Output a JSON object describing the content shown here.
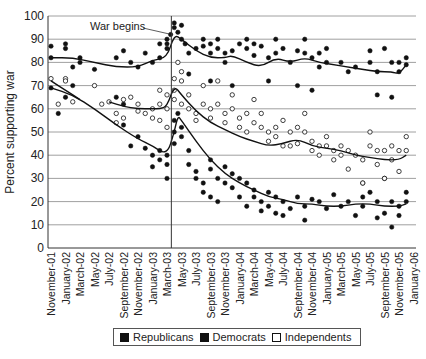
{
  "chart_data": {
    "type": "scatter",
    "title": "",
    "xlabel": "",
    "ylabel": "Percent supporting war",
    "ylim": [
      0,
      100
    ],
    "yticks": [
      0,
      10,
      20,
      30,
      40,
      50,
      60,
      70,
      80,
      90,
      100
    ],
    "grid": "horizontal",
    "x_tick_labels": [
      "November-01",
      "January-02",
      "March-02",
      "May-02",
      "July-02",
      "September-02",
      "November-02",
      "January-03",
      "March-03",
      "May-03",
      "July-03",
      "September-03",
      "November-03",
      "January-04",
      "March-04",
      "May-04",
      "July-04",
      "September-04",
      "November-04",
      "January-05",
      "March-05",
      "May-05",
      "July-05",
      "September-05",
      "November-05",
      "January-06"
    ],
    "x_unit": "months since November 2001 (0 = November-01, 50 = January-06)",
    "xlim": [
      0,
      50
    ],
    "annotation": {
      "text": "War begins",
      "x": 16.6
    },
    "legend": {
      "placement": "bottom",
      "entries": [
        "Republicans",
        "Democrats",
        "Independents"
      ]
    },
    "series": [
      {
        "name": "Republicans",
        "marker": "filled",
        "points": [
          [
            0,
            87
          ],
          [
            0,
            82
          ],
          [
            2,
            88
          ],
          [
            2,
            86
          ],
          [
            3,
            78
          ],
          [
            4,
            82
          ],
          [
            4,
            80
          ],
          [
            9,
            82
          ],
          [
            10,
            85
          ],
          [
            11,
            80
          ],
          [
            12,
            78
          ],
          [
            13,
            84
          ],
          [
            14,
            80
          ],
          [
            15,
            88
          ],
          [
            15,
            82
          ],
          [
            16,
            86
          ],
          [
            16,
            90
          ],
          [
            16,
            88
          ],
          [
            16.5,
            92
          ],
          [
            17,
            95
          ],
          [
            17,
            97
          ],
          [
            17.5,
            93
          ],
          [
            18,
            96
          ],
          [
            18,
            90
          ],
          [
            18.5,
            88
          ],
          [
            19,
            84
          ],
          [
            20,
            86
          ],
          [
            21,
            90
          ],
          [
            21,
            87
          ],
          [
            22,
            88
          ],
          [
            22,
            84
          ],
          [
            23,
            90
          ],
          [
            23,
            86
          ],
          [
            24,
            84
          ],
          [
            24,
            80
          ],
          [
            25,
            85
          ],
          [
            26,
            88
          ],
          [
            27,
            90
          ],
          [
            27,
            86
          ],
          [
            28,
            88
          ],
          [
            28,
            83
          ],
          [
            29,
            87
          ],
          [
            30,
            82
          ],
          [
            31,
            90
          ],
          [
            31,
            84
          ],
          [
            32,
            86
          ],
          [
            33,
            80
          ],
          [
            34,
            85
          ],
          [
            35,
            90
          ],
          [
            35,
            84
          ],
          [
            36,
            82
          ],
          [
            37,
            78
          ],
          [
            37,
            84
          ],
          [
            38,
            86
          ],
          [
            38,
            80
          ],
          [
            40,
            80
          ],
          [
            41,
            76
          ],
          [
            42,
            78
          ],
          [
            44,
            85
          ],
          [
            44,
            80
          ],
          [
            45,
            76
          ],
          [
            46,
            86
          ],
          [
            47,
            80
          ],
          [
            48,
            80
          ],
          [
            48,
            76
          ],
          [
            49,
            82
          ],
          [
            49,
            79
          ],
          [
            19,
            75
          ],
          [
            22,
            72
          ],
          [
            25,
            70
          ],
          [
            30,
            72
          ],
          [
            34,
            70
          ],
          [
            36,
            68
          ],
          [
            45,
            66
          ],
          [
            47,
            65
          ]
        ],
        "trend": [
          [
            0,
            82
          ],
          [
            3,
            82
          ],
          [
            6,
            80
          ],
          [
            9,
            78
          ],
          [
            12,
            78
          ],
          [
            14,
            81
          ],
          [
            16,
            82
          ],
          [
            17,
            92
          ],
          [
            18,
            90
          ],
          [
            20,
            85
          ],
          [
            22,
            82
          ],
          [
            24,
            82
          ],
          [
            25,
            83
          ],
          [
            27,
            80
          ],
          [
            29,
            78
          ],
          [
            31,
            82
          ],
          [
            33,
            80
          ],
          [
            35,
            82
          ],
          [
            37,
            80
          ],
          [
            39,
            79
          ],
          [
            41,
            78
          ],
          [
            43,
            77
          ],
          [
            45,
            76
          ],
          [
            47,
            76
          ],
          [
            48,
            75
          ],
          [
            49,
            79
          ]
        ]
      },
      {
        "name": "Democrats",
        "marker": "filled",
        "points": [
          [
            0,
            69
          ],
          [
            1,
            58
          ],
          [
            2,
            65
          ],
          [
            3,
            70
          ],
          [
            6,
            77
          ],
          [
            9,
            65
          ],
          [
            10,
            62
          ],
          [
            10,
            53
          ],
          [
            11,
            44
          ],
          [
            12,
            48
          ],
          [
            13,
            43
          ],
          [
            14,
            40
          ],
          [
            14,
            35
          ],
          [
            15,
            42
          ],
          [
            15,
            38
          ],
          [
            16,
            40
          ],
          [
            16,
            36
          ],
          [
            16,
            30
          ],
          [
            17,
            45
          ],
          [
            17,
            50
          ],
          [
            17,
            55
          ],
          [
            17.5,
            58
          ],
          [
            18,
            52
          ],
          [
            18,
            48
          ],
          [
            19,
            42
          ],
          [
            19,
            36
          ],
          [
            20,
            33
          ],
          [
            20,
            30
          ],
          [
            21,
            28
          ],
          [
            21,
            24
          ],
          [
            22,
            38
          ],
          [
            22,
            34
          ],
          [
            22,
            22
          ],
          [
            23,
            30
          ],
          [
            23,
            20
          ],
          [
            24,
            35
          ],
          [
            24,
            28
          ],
          [
            25,
            32
          ],
          [
            25,
            26
          ],
          [
            26,
            30
          ],
          [
            26,
            22
          ],
          [
            27,
            28
          ],
          [
            27,
            18
          ],
          [
            28,
            25
          ],
          [
            28,
            22
          ],
          [
            29,
            20
          ],
          [
            29,
            16
          ],
          [
            30,
            24
          ],
          [
            30,
            18
          ],
          [
            31,
            22
          ],
          [
            31,
            15
          ],
          [
            32,
            20
          ],
          [
            32,
            14
          ],
          [
            33,
            17
          ],
          [
            34,
            22
          ],
          [
            35,
            18
          ],
          [
            35,
            12
          ],
          [
            36,
            21
          ],
          [
            37,
            20
          ],
          [
            38,
            17
          ],
          [
            39,
            23
          ],
          [
            40,
            18
          ],
          [
            41,
            20
          ],
          [
            42,
            14
          ],
          [
            43,
            22
          ],
          [
            43,
            18
          ],
          [
            44,
            24
          ],
          [
            45,
            20
          ],
          [
            45,
            13
          ],
          [
            46,
            15
          ],
          [
            47,
            20
          ],
          [
            47,
            9
          ],
          [
            48,
            18
          ],
          [
            48,
            14
          ],
          [
            49,
            24
          ],
          [
            49,
            20
          ],
          [
            46,
            30
          ],
          [
            43,
            28
          ]
        ],
        "trend": [
          [
            0,
            69
          ],
          [
            3,
            66
          ],
          [
            6,
            60
          ],
          [
            9,
            53
          ],
          [
            12,
            47
          ],
          [
            14,
            44
          ],
          [
            16,
            40
          ],
          [
            17,
            50
          ],
          [
            17.5,
            57
          ],
          [
            18,
            55
          ],
          [
            20,
            46
          ],
          [
            22,
            38
          ],
          [
            24,
            32
          ],
          [
            26,
            28
          ],
          [
            28,
            25
          ],
          [
            30,
            22
          ],
          [
            32,
            21
          ],
          [
            34,
            19
          ],
          [
            36,
            19
          ],
          [
            38,
            18
          ],
          [
            40,
            18
          ],
          [
            42,
            19
          ],
          [
            44,
            19
          ],
          [
            46,
            18
          ],
          [
            48,
            18
          ],
          [
            49,
            19
          ]
        ]
      },
      {
        "name": "Independents",
        "marker": "open",
        "points": [
          [
            0,
            73
          ],
          [
            1,
            62
          ],
          [
            2,
            73
          ],
          [
            2,
            72
          ],
          [
            3,
            63
          ],
          [
            6,
            70
          ],
          [
            7,
            62
          ],
          [
            8,
            63
          ],
          [
            9,
            58
          ],
          [
            9,
            54
          ],
          [
            10,
            64
          ],
          [
            10,
            56
          ],
          [
            11,
            65
          ],
          [
            12,
            62
          ],
          [
            12,
            59
          ],
          [
            13,
            58
          ],
          [
            14,
            60
          ],
          [
            14,
            56
          ],
          [
            15,
            68
          ],
          [
            15,
            62
          ],
          [
            15,
            55
          ],
          [
            16,
            66
          ],
          [
            16,
            60
          ],
          [
            16,
            52
          ],
          [
            17,
            73
          ],
          [
            17,
            68
          ],
          [
            17,
            64
          ],
          [
            17.5,
            80
          ],
          [
            18,
            76
          ],
          [
            18,
            72
          ],
          [
            18,
            62
          ],
          [
            19,
            66
          ],
          [
            19,
            60
          ],
          [
            20,
            58
          ],
          [
            20,
            55
          ],
          [
            21,
            70
          ],
          [
            21,
            62
          ],
          [
            22,
            60
          ],
          [
            22,
            56
          ],
          [
            23,
            72
          ],
          [
            23,
            62
          ],
          [
            24,
            58
          ],
          [
            24,
            54
          ],
          [
            25,
            66
          ],
          [
            25,
            60
          ],
          [
            26,
            56
          ],
          [
            26,
            52
          ],
          [
            27,
            58
          ],
          [
            27,
            50
          ],
          [
            28,
            64
          ],
          [
            28,
            54
          ],
          [
            29,
            58
          ],
          [
            29,
            52
          ],
          [
            30,
            50
          ],
          [
            30,
            46
          ],
          [
            31,
            52
          ],
          [
            31,
            48
          ],
          [
            32,
            55
          ],
          [
            32,
            44
          ],
          [
            33,
            50
          ],
          [
            33,
            44
          ],
          [
            34,
            52
          ],
          [
            34,
            45
          ],
          [
            35,
            58
          ],
          [
            35,
            50
          ],
          [
            36,
            46
          ],
          [
            36,
            42
          ],
          [
            37,
            44
          ],
          [
            37,
            40
          ],
          [
            38,
            48
          ],
          [
            38,
            44
          ],
          [
            39,
            42
          ],
          [
            39,
            38
          ],
          [
            40,
            44
          ],
          [
            40,
            40
          ],
          [
            41,
            42
          ],
          [
            41,
            34
          ],
          [
            42,
            40
          ],
          [
            43,
            38
          ],
          [
            43,
            28
          ],
          [
            44,
            50
          ],
          [
            44,
            44
          ],
          [
            45,
            42
          ],
          [
            45,
            36
          ],
          [
            46,
            42
          ],
          [
            46,
            30
          ],
          [
            47,
            44
          ],
          [
            47,
            38
          ],
          [
            48,
            42
          ],
          [
            48,
            33
          ],
          [
            49,
            48
          ],
          [
            49,
            42
          ]
        ],
        "trend_segments": [
          [
            [
              0,
              72
            ],
            [
              2,
              68
            ],
            [
              4,
              64
            ]
          ],
          [
            [
              8,
              63
            ],
            [
              10,
              61
            ],
            [
              12,
              60
            ],
            [
              14,
              60
            ],
            [
              15,
              60
            ],
            [
              16,
              61
            ],
            [
              17,
              70
            ],
            [
              18,
              66
            ],
            [
              20,
              59
            ],
            [
              22,
              54
            ],
            [
              24,
              51
            ],
            [
              26,
              48
            ],
            [
              28,
              46
            ],
            [
              30,
              44
            ],
            [
              32,
              45
            ],
            [
              34,
              47
            ],
            [
              36,
              44
            ],
            [
              38,
              43
            ],
            [
              40,
              42
            ],
            [
              42,
              40
            ],
            [
              44,
              39
            ],
            [
              46,
              38
            ],
            [
              48,
              38
            ],
            [
              49,
              40
            ]
          ]
        ]
      }
    ]
  }
}
